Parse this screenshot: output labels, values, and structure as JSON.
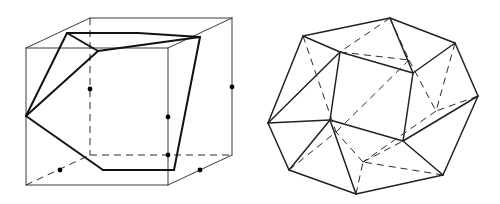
{
  "figure": {
    "background_color": "#ffffff",
    "line_color": "#2b2b2b",
    "bold_line_color": "#121212",
    "dot_color": "#000000",
    "width": 500,
    "height": 204
  },
  "left_figure": {
    "name": "cube-with-hexagonal-cross-section",
    "caption": "",
    "vertices": {
      "front_top_left": [
        26,
        48
      ],
      "front_top_right": [
        168,
        48
      ],
      "front_bottom_left": [
        27,
        185
      ],
      "front_bottom_right": [
        168,
        185
      ],
      "back_top_left": [
        90,
        18
      ],
      "back_top_right": [
        232,
        18
      ],
      "back_bottom_left": [
        90,
        155
      ],
      "back_bottom_right": [
        232,
        155
      ]
    },
    "hexagon_vertices": [
      [
        67,
        33
      ],
      [
        138,
        33
      ],
      [
        200,
        37
      ],
      [
        174,
        170
      ],
      [
        103,
        170
      ],
      [
        26,
        116
      ]
    ],
    "midpoint_dots": [
      [
        90,
        89
      ],
      [
        168,
        117
      ],
      [
        232,
        87
      ],
      [
        168,
        155
      ],
      [
        60,
        170
      ],
      [
        200,
        170
      ]
    ],
    "dot_radius": 2.4
  },
  "right_figure": {
    "name": "cuboctahedron",
    "caption": "",
    "outer_vertices": [
      [
        268,
        123
      ],
      [
        303,
        36
      ],
      [
        390,
        18
      ],
      [
        455,
        43
      ],
      [
        478,
        96
      ],
      [
        443,
        175
      ],
      [
        356,
        194
      ],
      [
        289,
        170
      ]
    ],
    "inner_vertices": [
      [
        340,
        52
      ],
      [
        413,
        73
      ],
      [
        403,
        141
      ],
      [
        330,
        120
      ]
    ]
  }
}
